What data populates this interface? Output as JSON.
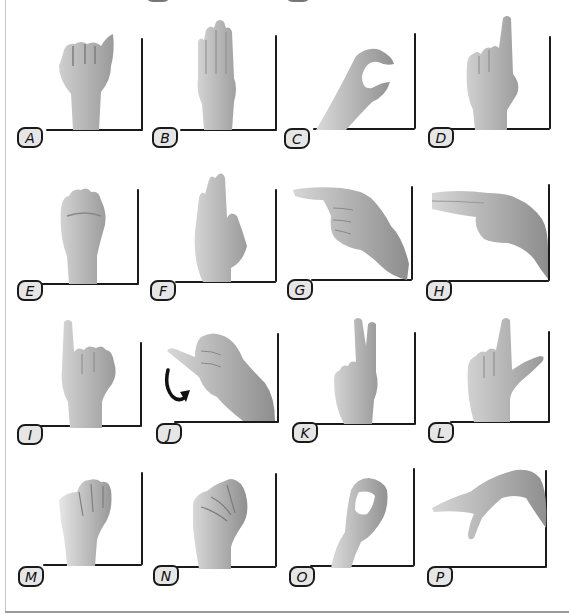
{
  "colors": {
    "line": "#1a1a1a",
    "badge_fill": "#e6e6e6",
    "skin_light": "#d9d9d9",
    "skin_mid": "#b3b3b3",
    "skin_dark": "#8a8a8a"
  },
  "signs": [
    {
      "letter": "A",
      "description": "closed fist, thumb along side",
      "row": 0,
      "col": 0
    },
    {
      "letter": "B",
      "description": "flat palm, fingers up, thumb folded",
      "row": 0,
      "col": 1
    },
    {
      "letter": "C",
      "description": "curved hand forming C",
      "row": 0,
      "col": 2
    },
    {
      "letter": "D",
      "description": "index up, others touching thumb",
      "row": 0,
      "col": 3
    },
    {
      "letter": "E",
      "description": "fingertips bent over thumb",
      "row": 1,
      "col": 0
    },
    {
      "letter": "F",
      "description": "three fingers up, index touching thumb",
      "row": 1,
      "col": 1
    },
    {
      "letter": "G",
      "description": "index pointing sideways",
      "row": 1,
      "col": 2
    },
    {
      "letter": "H",
      "description": "index and middle pointing sideways",
      "row": 1,
      "col": 3
    },
    {
      "letter": "I",
      "description": "pinky up, fist",
      "row": 2,
      "col": 0
    },
    {
      "letter": "J",
      "description": "pinky traces J",
      "row": 2,
      "col": 1,
      "motion_arrow": "curved-arrow"
    },
    {
      "letter": "K",
      "description": "index and middle up in V, thumb between",
      "row": 2,
      "col": 2
    },
    {
      "letter": "L",
      "description": "index up, thumb out forming L",
      "row": 2,
      "col": 3
    },
    {
      "letter": "M",
      "description": "thumb under three fingers",
      "row": 3,
      "col": 0
    },
    {
      "letter": "N",
      "description": "thumb under two fingers",
      "row": 3,
      "col": 1
    },
    {
      "letter": "O",
      "description": "fingers and thumb forming O",
      "row": 3,
      "col": 2
    },
    {
      "letter": "P",
      "description": "K shape pointed downward",
      "row": 3,
      "col": 3
    }
  ]
}
